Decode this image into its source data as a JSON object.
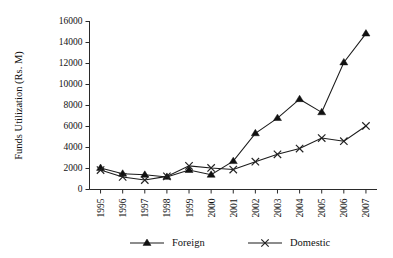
{
  "chart_data": {
    "type": "line",
    "title": "",
    "xlabel": "",
    "ylabel": "Funds Utilization (Rs. M)",
    "categories": [
      "1995",
      "1996",
      "1997",
      "1998",
      "1999",
      "2000",
      "2001",
      "2002",
      "2003",
      "2004",
      "2005",
      "2006",
      "2007"
    ],
    "x": [
      1995,
      1996,
      1997,
      1998,
      1999,
      2000,
      2001,
      2002,
      2003,
      2004,
      2005,
      2006,
      2007
    ],
    "series": [
      {
        "name": "Foreign",
        "marker": "filled-triangle",
        "values": [
          2050,
          1500,
          1400,
          1200,
          1850,
          1400,
          2700,
          5350,
          6800,
          8600,
          7350,
          12100,
          14850
        ]
      },
      {
        "name": "Domestic",
        "marker": "cross",
        "values": [
          1850,
          1200,
          900,
          1250,
          2250,
          2050,
          1900,
          2650,
          3350,
          3900,
          4900,
          4600,
          6050
        ]
      }
    ],
    "ylim": [
      0,
      16000
    ],
    "yticks": [
      0,
      2000,
      4000,
      6000,
      8000,
      10000,
      12000,
      14000,
      16000
    ],
    "ytick_labels": [
      "0",
      "2000",
      "4000",
      "6000",
      "8000",
      "10000",
      "12000",
      "14000",
      "16000"
    ],
    "grid": false,
    "legend_position": "bottom",
    "legend": [
      "Foreign",
      "Domestic"
    ],
    "colors": {
      "foreign": "#111111",
      "domestic": "#222222",
      "axis": "#2a2a2a",
      "background": "#ffffff"
    }
  }
}
